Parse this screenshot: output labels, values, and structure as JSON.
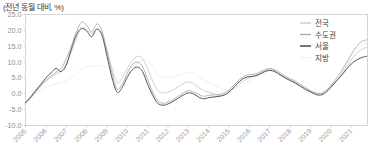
{
  "unit_label": "(전년 동월 대비, %)",
  "legend": {
    "position": "top-right",
    "items": [
      {
        "label": "전국",
        "color": "#c9c9c9",
        "swatch": "visible"
      },
      {
        "label": "수도권",
        "color": "#a8a8a8",
        "swatch": "visible"
      },
      {
        "label": "서울",
        "color": "#555555",
        "swatch": "visible"
      },
      {
        "label": "지방",
        "color": "#f2f2f2",
        "swatch": "hidden"
      }
    ]
  },
  "chart_data": {
    "type": "line",
    "title": "",
    "subtitle": "",
    "xlabel": "",
    "ylabel": "(전년 동월 대비, %)",
    "grid": false,
    "legend_position": "top-right",
    "ylim": [
      -10.0,
      25.0
    ],
    "xlim": [
      2005,
      2021.8
    ],
    "ytick_labels": [
      "25.0",
      "20.0",
      "15.0",
      "10.0",
      "5.0",
      "0.0",
      "-5.0",
      "-10.0"
    ],
    "ytick_values": [
      25.0,
      20.0,
      15.0,
      10.0,
      5.0,
      0.0,
      -5.0,
      -10.0
    ],
    "xtick_labels": [
      "2005",
      "2006",
      "2007",
      "2008",
      "2009",
      "2010",
      "2011",
      "2012",
      "2013",
      "2014",
      "2015",
      "2016",
      "2017",
      "2018",
      "2019",
      "2020",
      "2021"
    ],
    "xtick_values": [
      2005,
      2006,
      2007,
      2008,
      2009,
      2010,
      2011,
      2012,
      2013,
      2014,
      2015,
      2016,
      2017,
      2018,
      2019,
      2020,
      2021
    ],
    "x": [
      2005.0,
      2005.25,
      2005.5,
      2005.75,
      2006.0,
      2006.25,
      2006.5,
      2006.75,
      2007.0,
      2007.25,
      2007.5,
      2007.75,
      2008.0,
      2008.25,
      2008.5,
      2008.75,
      2009.0,
      2009.25,
      2009.5,
      2009.75,
      2010.0,
      2010.25,
      2010.5,
      2010.75,
      2011.0,
      2011.25,
      2011.5,
      2011.75,
      2012.0,
      2012.25,
      2012.5,
      2012.75,
      2013.0,
      2013.25,
      2013.5,
      2013.75,
      2014.0,
      2014.25,
      2014.5,
      2014.75,
      2015.0,
      2015.25,
      2015.5,
      2015.75,
      2016.0,
      2016.25,
      2016.5,
      2016.75,
      2017.0,
      2017.25,
      2017.5,
      2017.75,
      2018.0,
      2018.25,
      2018.5,
      2018.75,
      2019.0,
      2019.25,
      2019.5,
      2019.75,
      2020.0,
      2020.25,
      2020.5,
      2020.75,
      2021.0,
      2021.25,
      2021.5,
      2021.75
    ],
    "series": [
      {
        "name": "전국",
        "color": "#c9c9c9",
        "values": [
          -2.6,
          -1.2,
          0.8,
          2.6,
          4.0,
          5.2,
          6.2,
          7.0,
          9.5,
          13.0,
          17.5,
          20.5,
          20.2,
          19.0,
          20.3,
          19.0,
          14.0,
          8.0,
          3.5,
          5.0,
          8.0,
          10.5,
          11.8,
          11.0,
          8.0,
          4.0,
          1.0,
          0.3,
          0.6,
          1.2,
          2.2,
          3.2,
          3.8,
          3.2,
          2.0,
          1.0,
          0.5,
          0.0,
          -0.6,
          -0.4,
          0.4,
          1.6,
          3.0,
          4.2,
          5.0,
          5.6,
          6.4,
          7.3,
          7.6,
          7.2,
          6.2,
          5.2,
          4.4,
          3.6,
          2.6,
          1.6,
          0.8,
          0.3,
          0.2,
          1.0,
          2.4,
          4.0,
          6.0,
          8.2,
          10.6,
          12.6,
          14.0,
          14.6
        ]
      },
      {
        "name": "수도권",
        "color": "#a8a8a8",
        "values": [
          -3.0,
          -1.4,
          0.6,
          2.4,
          4.2,
          5.6,
          6.8,
          8.0,
          11.0,
          15.0,
          19.5,
          22.6,
          21.6,
          19.5,
          22.0,
          20.0,
          13.5,
          6.5,
          1.5,
          3.0,
          6.5,
          9.2,
          10.0,
          8.5,
          4.5,
          0.5,
          -2.2,
          -3.0,
          -2.6,
          -1.8,
          -0.8,
          0.3,
          1.0,
          0.6,
          -0.2,
          -0.8,
          -0.5,
          -0.3,
          -0.2,
          0.2,
          1.2,
          2.8,
          4.4,
          5.6,
          6.0,
          6.2,
          6.8,
          7.6,
          8.0,
          7.6,
          6.6,
          5.6,
          4.8,
          4.0,
          3.0,
          2.0,
          1.0,
          0.2,
          0.0,
          0.8,
          2.6,
          4.6,
          7.0,
          9.6,
          12.4,
          14.8,
          16.4,
          17.0
        ]
      },
      {
        "name": "서울",
        "color": "#555555",
        "values": [
          -2.8,
          -1.0,
          1.0,
          3.0,
          5.0,
          6.6,
          8.0,
          7.0,
          9.0,
          14.0,
          18.6,
          20.6,
          19.8,
          18.0,
          20.4,
          18.6,
          12.0,
          5.0,
          0.5,
          2.0,
          5.2,
          7.6,
          8.4,
          7.0,
          3.0,
          -0.5,
          -3.0,
          -3.6,
          -3.2,
          -2.4,
          -1.4,
          -0.4,
          0.3,
          0.0,
          -1.0,
          -1.6,
          -1.2,
          -1.0,
          -0.8,
          -0.4,
          0.6,
          2.2,
          3.8,
          5.0,
          5.4,
          5.6,
          6.2,
          7.0,
          7.4,
          7.0,
          6.0,
          5.0,
          4.2,
          3.4,
          2.4,
          1.4,
          0.6,
          -0.2,
          -0.4,
          0.4,
          2.0,
          3.8,
          5.6,
          7.6,
          9.4,
          10.6,
          11.4,
          11.8
        ]
      },
      {
        "name": "지방",
        "color": "#ececec",
        "values": [
          -2.0,
          -1.0,
          0.2,
          1.2,
          2.0,
          2.6,
          3.2,
          3.6,
          4.2,
          5.0,
          6.2,
          7.6,
          8.4,
          8.6,
          9.0,
          8.8,
          8.4,
          7.8,
          6.4,
          6.2,
          7.2,
          8.6,
          9.8,
          10.6,
          10.4,
          8.6,
          6.2,
          5.2,
          5.0,
          5.2,
          5.8,
          6.4,
          6.8,
          6.4,
          5.4,
          4.4,
          3.6,
          2.8,
          2.0,
          1.4,
          1.2,
          1.4,
          2.0,
          3.0,
          4.0,
          4.8,
          5.8,
          6.8,
          7.2,
          6.8,
          5.8,
          4.8,
          4.0,
          3.2,
          2.2,
          1.2,
          0.4,
          0.0,
          0.2,
          1.4,
          3.0,
          4.6,
          6.6,
          8.8,
          11.4,
          13.6,
          15.2,
          16.0
        ]
      }
    ]
  }
}
